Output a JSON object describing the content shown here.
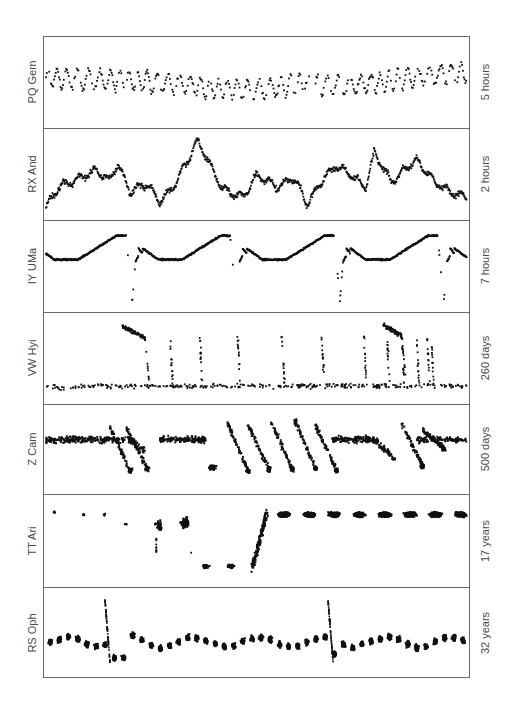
{
  "chart_data": {
    "type": "scatter",
    "title": "",
    "layout": "7 vertically stacked light-curve panels in a single frame; star name at left (rotated), time span at right (rotated); no axis ticks, no grid",
    "xlabel": "",
    "ylabel": "",
    "grid": false,
    "legend": "none",
    "panels": [
      {
        "name": "PQ Gem",
        "timespan": "5 hours",
        "description": "Rapid flickering/oscillations around a nearly constant mean, slight rise at the end",
        "trend_x": [
          0,
          0.1,
          0.2,
          0.3,
          0.4,
          0.5,
          0.6,
          0.7,
          0.8,
          0.9,
          1.0
        ],
        "trend_y": [
          0.55,
          0.53,
          0.52,
          0.48,
          0.42,
          0.4,
          0.48,
          0.45,
          0.5,
          0.58,
          0.62
        ],
        "oscillation_cycles": 42,
        "oscillation_amplitude": 0.12
      },
      {
        "name": "RX And",
        "timespan": "2 hours",
        "description": "Flickering light curve with large random-walk variations and a prominent peak near 30%",
        "x": [
          0,
          0.03,
          0.08,
          0.12,
          0.15,
          0.17,
          0.2,
          0.24,
          0.27,
          0.3,
          0.33,
          0.36,
          0.42,
          0.47,
          0.5,
          0.55,
          0.59,
          0.62,
          0.66,
          0.69,
          0.72,
          0.76,
          0.78,
          0.82,
          0.84,
          0.88,
          0.92,
          0.95,
          1.0
        ],
        "y": [
          0.08,
          0.33,
          0.45,
          0.55,
          0.42,
          0.62,
          0.28,
          0.38,
          0.15,
          0.32,
          0.6,
          0.92,
          0.3,
          0.22,
          0.48,
          0.34,
          0.45,
          0.12,
          0.45,
          0.6,
          0.5,
          0.33,
          0.78,
          0.4,
          0.5,
          0.68,
          0.42,
          0.3,
          0.2
        ]
      },
      {
        "name": "IY UMa",
        "timespan": "7 hours",
        "description": "Eclipsing dwarf nova: flat baseline, orbital hump rising to a maximum, then a deep eclipse; four cycles",
        "eclipse_x": [
          0.205,
          0.452,
          0.698,
          0.945
        ],
        "cycle_length": 0.247,
        "baseline_y": 0.58,
        "hump_max_y": 0.88,
        "eclipse_min_y": 0.05
      },
      {
        "name": "VW Hyi",
        "timespan": "260 days",
        "description": "SU UMa dwarf nova: quiescence with frequent short normal outbursts and two longer superoutbursts",
        "quiescence_y": 0.15,
        "superoutbursts": [
          {
            "start": 0.18,
            "end": 0.235,
            "peak_y": 0.9
          },
          {
            "start": 0.8,
            "end": 0.845,
            "peak_y": 0.92
          }
        ],
        "normal_outbursts_x": [
          0.295,
          0.365,
          0.455,
          0.56,
          0.655,
          0.755,
          0.81,
          0.845,
          0.88,
          0.905,
          0.915,
          1.01,
          1.07
        ],
        "normal_outburst_peak_y": 0.78
      },
      {
        "name": "Z Cam",
        "timespan": "500 days",
        "description": "Z Cam dwarf nova: standstill intervals at intermediate brightness interrupted by outburst/decline cycles",
        "standstill_y": 0.62,
        "segments": [
          {
            "x0": 0.0,
            "x1": 0.3,
            "mode": "standstill"
          },
          {
            "x0": 0.3,
            "x1": 0.5,
            "mode": "cycles",
            "peaks_x": [
              0.15,
              0.19
            ],
            "low_y": 0.25
          },
          {
            "x0": 0.19,
            "x1": 0.38,
            "mode": "standstill"
          },
          {
            "x0": 0.38,
            "x1": 0.68,
            "mode": "cycles",
            "peaks_x": [
              0.43,
              0.48,
              0.53,
              0.59,
              0.64
            ],
            "high_y": 0.85,
            "low_y": 0.22
          },
          {
            "x0": 0.68,
            "x1": 0.8,
            "mode": "standstill_decline"
          },
          {
            "x0": 0.84,
            "x1": 0.89,
            "mode": "cycles",
            "peaks_x": [
              0.85
            ],
            "low_y": 0.28
          },
          {
            "x0": 0.9,
            "x1": 1.0,
            "mode": "standstill"
          }
        ]
      },
      {
        "name": "TT Ari",
        "timespan": "17 years",
        "description": "Nova-like: sparse early high-state points, a deep low state, recovery, then regular seasonal clumps at high state",
        "early_points": [
          {
            "x": 0.02,
            "y": 0.85
          },
          {
            "x": 0.09,
            "y": 0.82
          },
          {
            "x": 0.14,
            "y": 0.82
          },
          {
            "x": 0.19,
            "y": 0.7
          },
          {
            "x": 0.26,
            "y": 0.7
          },
          {
            "x": 0.32,
            "y": 0.72
          }
        ],
        "low_state_clumps": [
          {
            "x": 0.38,
            "y": 0.18
          },
          {
            "x": 0.44,
            "y": 0.18
          }
        ],
        "recovery": {
          "x0": 0.49,
          "x1": 0.525,
          "y0": 0.15,
          "y1": 0.85
        },
        "high_state_clumps_x": [
          0.565,
          0.625,
          0.685,
          0.745,
          0.805,
          0.865,
          0.925,
          0.985
        ],
        "high_state_y": 0.82
      },
      {
        "name": "RS Oph",
        "timespan": "32 years",
        "description": "Recurrent nova: seasonal clumps near a constant level with two sharp nova eruptions",
        "baseline_y": 0.38,
        "eruptions": [
          {
            "x": 0.14,
            "peak_y": 0.93
          },
          {
            "x": 0.67,
            "peak_y": 0.9
          }
        ],
        "seasonal_clumps": 46
      }
    ]
  },
  "figure": {
    "frame": {
      "left": 43,
      "top": 36,
      "width": 427,
      "height": 642
    },
    "panel_tops": [
      36,
      128,
      220,
      312,
      404,
      494,
      587
    ],
    "panel_heights": [
      92,
      92,
      92,
      92,
      90,
      93,
      91
    ],
    "ink_color": "#111111",
    "frame_color": "#6a6a6a",
    "label_color": "#4a4a4a"
  }
}
